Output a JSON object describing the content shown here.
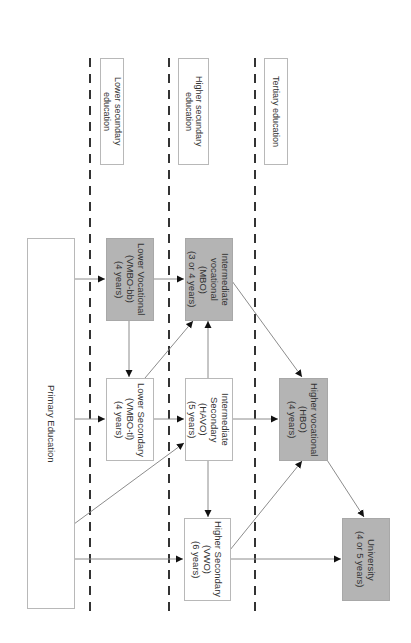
{
  "diagram": {
    "orientation": "rotated 90deg clockwise",
    "stages": [
      {
        "label": "Lower secundary\neducation"
      },
      {
        "label": "Higher secundary\neducation"
      },
      {
        "label": "Tertiary education"
      }
    ],
    "nodes": {
      "primary": {
        "label": "Primary Education",
        "fill": "white"
      },
      "lower_vocational": {
        "label": "Lower Vocational\n(VMBO-bb)\n(4 years)",
        "fill": "gray"
      },
      "lower_secondary": {
        "label": "Lower Secondary\n(VMBO-tl)\n(4 years)",
        "fill": "white"
      },
      "intermediate_vocational": {
        "label": "Intermediate\nvocational\n(MBO)\n(3 or 4 years)",
        "fill": "gray"
      },
      "intermediate_secondary": {
        "label": "Intermediate\nSecondary\n(HAVO)\n(5 years)",
        "fill": "white"
      },
      "higher_secondary": {
        "label": "Higher Secondary\n(VWO)\n(6 years)",
        "fill": "white"
      },
      "higher_vocational": {
        "label": "Higher vocational\n(HBO)\n(4 years)",
        "fill": "gray"
      },
      "university": {
        "label": "University\n(4 or 5 years)",
        "fill": "gray"
      }
    },
    "edges": [
      {
        "from": "primary",
        "to": "lower_vocational"
      },
      {
        "from": "primary",
        "to": "lower_secondary"
      },
      {
        "from": "primary",
        "to": "intermediate_secondary"
      },
      {
        "from": "primary",
        "to": "higher_secondary"
      },
      {
        "from": "lower_vocational",
        "to": "lower_secondary"
      },
      {
        "from": "lower_vocational",
        "to": "intermediate_vocational"
      },
      {
        "from": "lower_secondary",
        "to": "intermediate_vocational"
      },
      {
        "from": "lower_secondary",
        "to": "intermediate_secondary"
      },
      {
        "from": "intermediate_secondary",
        "to": "intermediate_vocational"
      },
      {
        "from": "intermediate_secondary",
        "to": "higher_secondary"
      },
      {
        "from": "intermediate_secondary",
        "to": "higher_vocational"
      },
      {
        "from": "intermediate_vocational",
        "to": "higher_vocational"
      },
      {
        "from": "higher_secondary",
        "to": "higher_vocational"
      },
      {
        "from": "higher_secondary",
        "to": "university"
      },
      {
        "from": "higher_vocational",
        "to": "university"
      }
    ],
    "colors": {
      "gray_fill": "#b4b4b4",
      "line": "#888888",
      "dash": "#333333"
    }
  }
}
